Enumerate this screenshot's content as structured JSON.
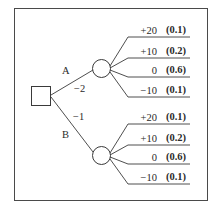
{
  "diagram": {
    "type": "decision-tree",
    "decision_node": {
      "shape": "square"
    },
    "branches": [
      {
        "label": "A",
        "cost": "−2",
        "chance_node": {
          "shape": "circle"
        },
        "outcomes": [
          {
            "value": "+20",
            "probability": "(0.1)"
          },
          {
            "value": "+10",
            "probability": "(0.2)"
          },
          {
            "value": "0",
            "probability": "(0.6)"
          },
          {
            "value": "−10",
            "probability": "(0.1)"
          }
        ]
      },
      {
        "label": "B",
        "cost": "−1",
        "chance_node": {
          "shape": "circle"
        },
        "outcomes": [
          {
            "value": "+20",
            "probability": "(0.1)"
          },
          {
            "value": "+10",
            "probability": "(0.2)"
          },
          {
            "value": "0",
            "probability": "(0.6)"
          },
          {
            "value": "−10",
            "probability": "(0.1)"
          }
        ]
      }
    ],
    "colors": {
      "line": "#3a3a3a",
      "text": "#2a2a2a",
      "background": "#ffffff",
      "frame": "#4a4a4a"
    }
  }
}
